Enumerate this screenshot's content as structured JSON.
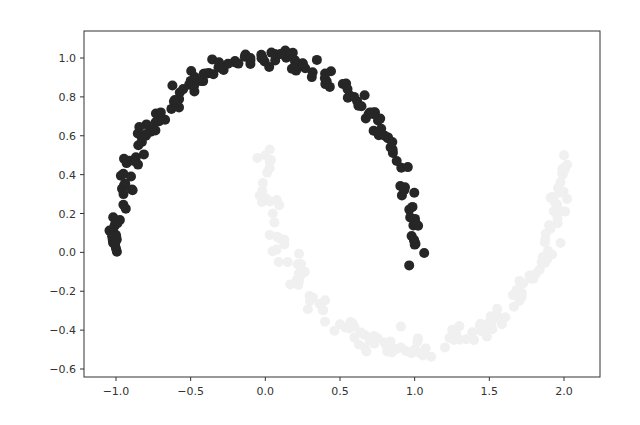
{
  "chart_data": {
    "type": "scatter",
    "title": "",
    "xlabel": "",
    "ylabel": "",
    "xlim": [
      -1.1,
      2.1
    ],
    "ylim": [
      -0.63,
      1.12
    ],
    "grid": false,
    "legend": null,
    "x_ticks": [
      -1.0,
      -0.5,
      0.0,
      0.5,
      1.0,
      1.5,
      2.0
    ],
    "x_tick_labels": [
      "−1.0",
      "−0.5",
      "0.0",
      "0.5",
      "1.0",
      "1.5",
      "2.0"
    ],
    "y_ticks": [
      1.0,
      0.8,
      0.6,
      0.4,
      0.2,
      0.0,
      -0.2,
      -0.4,
      -0.6
    ],
    "y_tick_labels": [
      "1.0",
      "0.8",
      "0.6",
      "0.4",
      "0.2",
      "0.0",
      "−0.2",
      "−0.4",
      "−0.6"
    ],
    "series": [
      {
        "name": "class 0 (upper moon)",
        "color": "#262626",
        "marker_radius": 5,
        "shape": "upper arc: x = cos(t), y = sin(t), t in [0, pi]",
        "n_points": 150,
        "noise": 0.03,
        "sample_points": [
          [
            -1.0,
            0.02
          ],
          [
            -0.99,
            0.15
          ],
          [
            -0.95,
            0.3
          ],
          [
            -0.88,
            0.47
          ],
          [
            -0.8,
            0.6
          ],
          [
            -0.7,
            0.72
          ],
          [
            -0.55,
            0.84
          ],
          [
            -0.4,
            0.92
          ],
          [
            -0.25,
            0.97
          ],
          [
            -0.1,
            1.0
          ],
          [
            0.1,
            1.02
          ],
          [
            0.25,
            0.97
          ],
          [
            0.4,
            0.92
          ],
          [
            0.55,
            0.84
          ],
          [
            0.7,
            0.72
          ],
          [
            0.8,
            0.6
          ],
          [
            0.88,
            0.47
          ],
          [
            0.93,
            0.32
          ],
          [
            0.97,
            0.18
          ],
          [
            1.0,
            0.04
          ]
        ]
      },
      {
        "name": "class 1 (lower moon)",
        "color": "#f0f0f0",
        "marker_radius": 5,
        "shape": "lower arc: x = 1 - cos(t), y = 0.5 - sin(t), t in [0, pi]",
        "n_points": 150,
        "noise": 0.03,
        "sample_points": [
          [
            0.0,
            0.5
          ],
          [
            0.05,
            0.2
          ],
          [
            0.15,
            -0.05
          ],
          [
            0.3,
            -0.25
          ],
          [
            0.5,
            -0.37
          ],
          [
            0.7,
            -0.45
          ],
          [
            1.0,
            -0.5
          ],
          [
            1.3,
            -0.45
          ],
          [
            1.5,
            -0.37
          ],
          [
            1.7,
            -0.25
          ],
          [
            1.85,
            -0.05
          ],
          [
            1.95,
            0.2
          ],
          [
            2.0,
            0.5
          ]
        ]
      }
    ]
  }
}
